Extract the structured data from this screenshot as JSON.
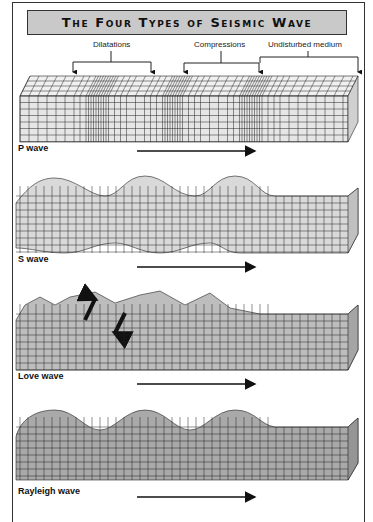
{
  "title": "The Four Types of Seismic Wave",
  "annotations": {
    "dilatations": "Dilatations",
    "compressions": "Compressions",
    "undisturbed": "Undisturbed medium"
  },
  "panels": [
    {
      "id": "p",
      "label": "P wave",
      "fill": "#e6e6e6"
    },
    {
      "id": "s",
      "label": "S wave",
      "fill": "#d9d9d9"
    },
    {
      "id": "love",
      "label": "Love wave",
      "fill": "#bdbdbd"
    },
    {
      "id": "rayleigh",
      "label": "Rayleigh wave",
      "fill": "#a9a9a9"
    }
  ],
  "colors": {
    "frame": "#333333",
    "title_bg": "#c9c9c9",
    "grid_line": "#222222"
  }
}
